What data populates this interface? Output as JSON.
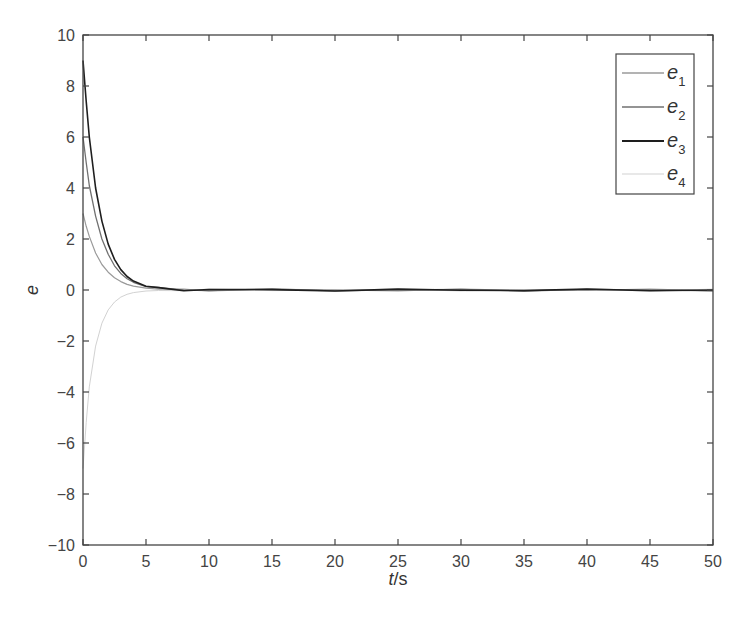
{
  "chart_data": {
    "type": "line",
    "title": "",
    "xlabel": "t/s",
    "xlabel_italic_part": "t",
    "xlabel_unit_part": "/s",
    "ylabel": "e",
    "xlim": [
      0,
      50
    ],
    "ylim": [
      -10,
      10
    ],
    "xticks": [
      0,
      5,
      10,
      15,
      20,
      25,
      30,
      35,
      40,
      45,
      50
    ],
    "yticks": [
      -10,
      -8,
      -6,
      -4,
      -2,
      0,
      2,
      4,
      6,
      8,
      10
    ],
    "grid": false,
    "legend_position": "upper right",
    "x": [
      0,
      0.25,
      0.5,
      1,
      1.5,
      2,
      2.5,
      3,
      3.5,
      4,
      5,
      6,
      8,
      10,
      15,
      20,
      25,
      30,
      35,
      40,
      45,
      50
    ],
    "series": [
      {
        "name": "e1",
        "label_base": "e",
        "label_sub": "1",
        "color": "#9a9a9a",
        "width": 1.2,
        "values": [
          3.0,
          2.5,
          2.1,
          1.45,
          1.0,
          0.7,
          0.48,
          0.33,
          0.22,
          0.15,
          0.07,
          0.03,
          0.01,
          0.0,
          0.0,
          0.0,
          0.0,
          0.0,
          0.0,
          0.0,
          0.0,
          0.0
        ]
      },
      {
        "name": "e2",
        "label_base": "e",
        "label_sub": "2",
        "color": "#707070",
        "width": 1.3,
        "values": [
          6.0,
          5.0,
          4.1,
          2.9,
          2.0,
          1.4,
          0.95,
          0.65,
          0.44,
          0.3,
          0.13,
          0.06,
          0.01,
          0.0,
          0.0,
          0.0,
          0.0,
          0.0,
          0.0,
          0.0,
          0.0,
          0.0
        ]
      },
      {
        "name": "e3",
        "label_base": "e",
        "label_sub": "3",
        "color": "#1e1e1e",
        "width": 1.6,
        "values": [
          9.0,
          7.4,
          6.0,
          4.0,
          2.7,
          1.8,
          1.2,
          0.8,
          0.53,
          0.35,
          0.15,
          0.06,
          0.01,
          0.0,
          0.0,
          0.0,
          0.0,
          0.0,
          0.0,
          0.0,
          0.0,
          0.0
        ]
      },
      {
        "name": "e4",
        "label_base": "e",
        "label_sub": "4",
        "color": "#d2d2d2",
        "width": 1.0,
        "values": [
          -7.0,
          -5.2,
          -3.8,
          -2.2,
          -1.3,
          -0.78,
          -0.47,
          -0.28,
          -0.17,
          -0.1,
          -0.04,
          -0.02,
          0.0,
          0.0,
          0.0,
          0.0,
          0.0,
          0.0,
          0.0,
          0.0,
          0.0,
          0.0
        ]
      }
    ]
  }
}
